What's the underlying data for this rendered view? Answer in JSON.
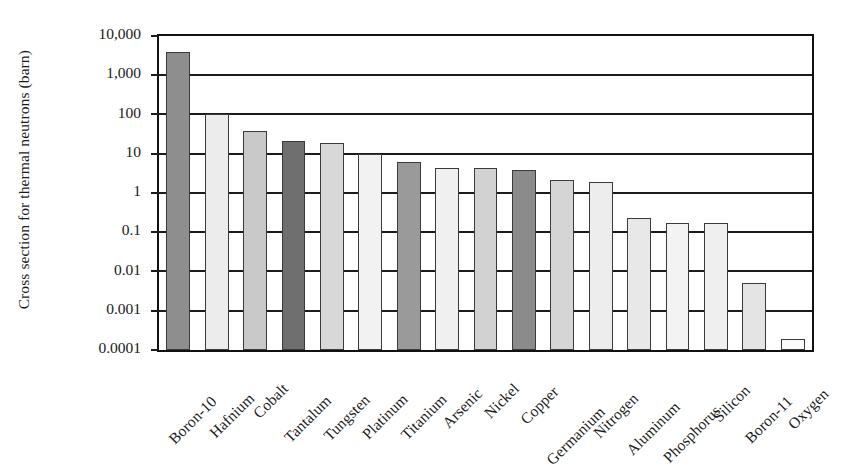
{
  "chart_data": {
    "type": "bar",
    "title": "",
    "subtitle": "",
    "xlabel": "",
    "ylabel": "Cross section for thermal neutrons (barn)",
    "yscale": "log",
    "ylim": [
      0.0001,
      10000
    ],
    "grid": true,
    "legend": false,
    "y_tick_labels": [
      "10,000",
      "1,000",
      "100",
      "10",
      "1",
      "0.1",
      "0.01",
      "0.001",
      "0.0001"
    ],
    "y_tick_values": [
      10000,
      1000,
      100,
      10,
      1,
      0.1,
      0.01,
      0.001,
      0.0001
    ],
    "categories": [
      "Boron-10",
      "Hafnium",
      "Cobalt",
      "Tantalum",
      "Tungsten",
      "Platinum",
      "Titanium",
      "Arsenic",
      "Nickel",
      "Copper",
      "Germanium",
      "Nitrogen",
      "Aluminum",
      "Phosphorus",
      "Silicon",
      "Boron-11",
      "Oxygen"
    ],
    "values": [
      3840,
      105,
      37.2,
      20.6,
      18.4,
      10.0,
      6.1,
      4.3,
      4.4,
      3.8,
      2.2,
      1.9,
      0.23,
      0.17,
      0.17,
      0.005,
      0.00019
    ],
    "bar_colors": [
      "#8e8e8e",
      "#ececec",
      "#c9c9c9",
      "#6f6f6f",
      "#d8d8d8",
      "#f2f2f2",
      "#9a9a9a",
      "#f0f0f0",
      "#d2d2d2",
      "#8b8b8b",
      "#d5d5d5",
      "#ededed",
      "#e8e8e8",
      "#f3f3f3",
      "#efefef",
      "#e4e4e4",
      "#fbfbfb"
    ],
    "series": [
      {
        "name": "Cross section for thermal neutrons (barn)",
        "values": [
          3840,
          105,
          37.2,
          20.6,
          18.4,
          10.0,
          6.1,
          4.3,
          4.4,
          3.8,
          2.2,
          1.9,
          0.23,
          0.17,
          0.17,
          0.005,
          0.00019
        ]
      }
    ]
  },
  "axis": {
    "y_title": "Cross section for thermal neutrons (barn)"
  }
}
